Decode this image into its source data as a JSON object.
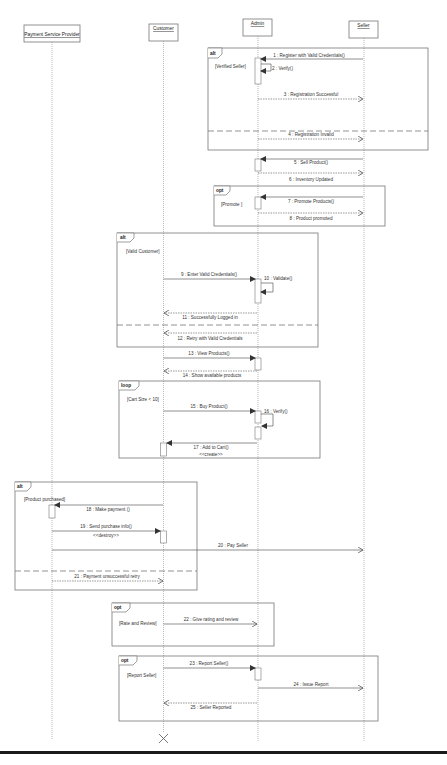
{
  "diagram": {
    "type": "UML sequence diagram",
    "lifelines": [
      {
        "id": "psp",
        "label": "Payment Service Provider",
        "x": 51
      },
      {
        "id": "customer",
        "label": "Customer",
        "x": 163
      },
      {
        "id": "admin",
        "label": "Admin",
        "x": 257
      },
      {
        "id": "seller",
        "label": "Seller",
        "x": 363
      }
    ],
    "frames": [
      {
        "id": "f1",
        "operator": "alt",
        "guard": "[Verified Seller]",
        "operand_separator": true
      },
      {
        "id": "f2",
        "operator": "opt",
        "guard": "[Promote ]",
        "operand_separator": false
      },
      {
        "id": "f3",
        "operator": "alt",
        "guard": "[Valid Customer]",
        "operand_separator": true
      },
      {
        "id": "f4",
        "operator": "loop",
        "guard": "[Cart Size < 10]",
        "operand_separator": false
      },
      {
        "id": "f5",
        "operator": "alt",
        "guard": "[Product purchased]",
        "operand_separator": true
      },
      {
        "id": "f6",
        "operator": "opt",
        "guard": "[Rate and Review]",
        "operand_separator": false
      },
      {
        "id": "f7",
        "operator": "opt",
        "guard": "[Report Seller]",
        "operand_separator": false
      }
    ],
    "messages": [
      {
        "n": 1,
        "label": "1 : Register with Valid Credentials()",
        "from": "seller",
        "to": "admin",
        "kind": "sync"
      },
      {
        "n": 2,
        "label": "2 : Verify()",
        "from": "admin",
        "to": "admin",
        "kind": "self"
      },
      {
        "n": 3,
        "label": "3 : Registration Successful",
        "from": "admin",
        "to": "seller",
        "kind": "reply"
      },
      {
        "n": 4,
        "label": "4 : Registration Invalid",
        "from": "admin",
        "to": "seller",
        "kind": "reply"
      },
      {
        "n": 5,
        "label": "5 : Sell Product()",
        "from": "seller",
        "to": "admin",
        "kind": "sync"
      },
      {
        "n": 6,
        "label": "6 : Inventory Updated",
        "from": "admin",
        "to": "seller",
        "kind": "reply"
      },
      {
        "n": 7,
        "label": "7 : Promote Products()",
        "from": "seller",
        "to": "admin",
        "kind": "sync"
      },
      {
        "n": 8,
        "label": "8 : Product promoted",
        "from": "admin",
        "to": "seller",
        "kind": "reply"
      },
      {
        "n": 9,
        "label": "9 : Enter Valid Credentials()",
        "from": "customer",
        "to": "admin",
        "kind": "sync"
      },
      {
        "n": 10,
        "label": "10 : Validate()",
        "from": "admin",
        "to": "admin",
        "kind": "self"
      },
      {
        "n": 11,
        "label": "11 : Successfully Logged in",
        "from": "admin",
        "to": "customer",
        "kind": "reply"
      },
      {
        "n": 12,
        "label": "12 : Retry with Valid Credentials",
        "from": "admin",
        "to": "customer",
        "kind": "reply"
      },
      {
        "n": 13,
        "label": "13 : View Products()",
        "from": "customer",
        "to": "admin",
        "kind": "sync"
      },
      {
        "n": 14,
        "label": "14 : Show available products",
        "from": "admin",
        "to": "customer",
        "kind": "reply"
      },
      {
        "n": 15,
        "label": "15 : Buy Product()",
        "from": "customer",
        "to": "admin",
        "kind": "sync"
      },
      {
        "n": 16,
        "label": "16 : Verify()",
        "from": "admin",
        "to": "admin",
        "kind": "self"
      },
      {
        "n": 17,
        "label": "17 : Add to Cart()",
        "stereotype": "<<create>>",
        "from": "admin",
        "to": "customer",
        "kind": "sync"
      },
      {
        "n": 18,
        "label": "18 : Make payment ()",
        "from": "customer",
        "to": "psp",
        "kind": "sync"
      },
      {
        "n": 19,
        "label": "19 : Send purchase info()",
        "stereotype": "<<destroy>>",
        "from": "psp",
        "to": "customer",
        "kind": "sync"
      },
      {
        "n": 20,
        "label": "20 : Pay Seller",
        "from": "psp",
        "to": "seller",
        "kind": "async"
      },
      {
        "n": 21,
        "label": "21 : Payment unsuccessful retry",
        "from": "psp",
        "to": "customer",
        "kind": "reply"
      },
      {
        "n": 22,
        "label": "22 : Give rating and review",
        "from": "customer",
        "to": "admin",
        "kind": "async"
      },
      {
        "n": 23,
        "label": "23 : Report Seller()",
        "from": "customer",
        "to": "admin",
        "kind": "sync"
      },
      {
        "n": 24,
        "label": "24 : Issue  Report",
        "from": "admin",
        "to": "seller",
        "kind": "async"
      },
      {
        "n": 25,
        "label": "25 : Seller Reported",
        "from": "admin",
        "to": "customer",
        "kind": "reply"
      }
    ],
    "destruction": {
      "lifeline": "customer",
      "marker": "X"
    },
    "colors": {
      "line": "#555555",
      "frame": "#777777",
      "background": "#ffffff",
      "bottom_bar": "#1a1a1a"
    }
  }
}
